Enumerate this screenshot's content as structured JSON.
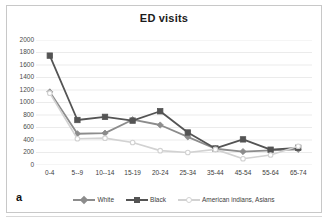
{
  "figure": {
    "panel_letter": "a",
    "title": "ED visits"
  },
  "axes": {
    "y_ticks": [
      "0",
      "200",
      "400",
      "600",
      "800",
      "1000",
      "1200",
      "1400",
      "1600",
      "1800",
      "2000"
    ],
    "x_ticks": [
      "0-4",
      "5--9",
      "10--14",
      "15-19",
      "20-24",
      "25-34",
      "35-44",
      "45-54",
      "55-64",
      "65-74"
    ]
  },
  "legend": {
    "items": [
      {
        "label": "White",
        "color": "#8c8c8c",
        "marker": "diamond"
      },
      {
        "label": "Black",
        "color": "#545454",
        "marker": "square"
      },
      {
        "label": "American indians, Asians",
        "color": "#d2d2d2",
        "marker": "circle"
      }
    ]
  },
  "colors": {
    "white_series": "#8c8c8c",
    "black_series": "#545454",
    "ai_series": "#d2d2d2",
    "gridline": "#e3e3e3",
    "axis_text": "#4a4a4a",
    "title_text": "#1b1b1b",
    "frame": "#c8c8c8"
  },
  "chart_data": {
    "type": "line",
    "title": "ED visits",
    "xlabel": "",
    "ylabel": "",
    "ylim": [
      0,
      2000
    ],
    "ytick_step": 200,
    "grid": true,
    "legend_position": "bottom",
    "categories": [
      "0-4",
      "5--9",
      "10--14",
      "15-19",
      "20-24",
      "25-34",
      "35-44",
      "45-54",
      "55-64",
      "65-74"
    ],
    "series": [
      {
        "name": "White",
        "color": "#8c8c8c",
        "marker": "diamond",
        "values": [
          1170,
          500,
          510,
          725,
          640,
          450,
          260,
          215,
          235,
          250
        ]
      },
      {
        "name": "Black",
        "color": "#545454",
        "marker": "square",
        "values": [
          1750,
          720,
          770,
          710,
          860,
          520,
          265,
          410,
          245,
          275
        ]
      },
      {
        "name": "American indians, Asians",
        "color": "#d2d2d2",
        "marker": "circle",
        "values": [
          1150,
          420,
          430,
          360,
          230,
          200,
          250,
          100,
          160,
          300
        ]
      }
    ]
  }
}
